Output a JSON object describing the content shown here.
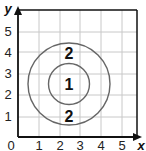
{
  "diagram": {
    "type": "coordinate-grid-concentric-circles",
    "axes": {
      "x_label": "x",
      "y_label": "y",
      "origin_label": "0",
      "x_ticks": [
        "1",
        "2",
        "3",
        "4",
        "5"
      ],
      "y_ticks": [
        "1",
        "2",
        "3",
        "4",
        "5"
      ],
      "x_range": [
        0,
        5.7
      ],
      "y_range": [
        0,
        6
      ],
      "grid": true
    },
    "circles": [
      {
        "name": "inner",
        "center": [
          2.5,
          2.5
        ],
        "radius": 1
      },
      {
        "name": "outer",
        "center": [
          2.5,
          2.5
        ],
        "radius": 2
      }
    ],
    "region_labels": [
      {
        "text": "1",
        "position": [
          2.5,
          2.5
        ]
      },
      {
        "text": "2",
        "position": [
          2.5,
          4.0
        ]
      },
      {
        "text": "2",
        "position": [
          2.5,
          1.0
        ]
      }
    ],
    "colors": {
      "axis": "#111111",
      "grid": "#c8c8c8",
      "circle": "#666666",
      "text": "#111111"
    }
  }
}
